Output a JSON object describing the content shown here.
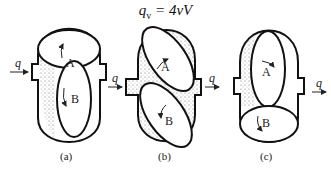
{
  "formula": {
    "lhs": "q",
    "sub": "v",
    "rhs": " = 4vV"
  },
  "flow_label": "q",
  "rotor_labels": {
    "a": "A",
    "b": "B"
  },
  "panels": [
    {
      "caption": "(a)"
    },
    {
      "caption": "(b)"
    },
    {
      "caption": "(c)"
    }
  ]
}
